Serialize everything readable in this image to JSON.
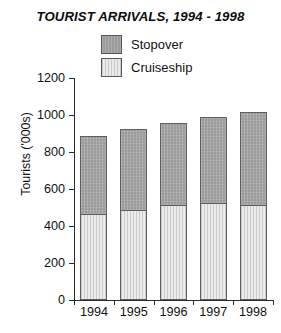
{
  "chart_data": {
    "type": "bar",
    "title": "TOURIST ARRIVALS, 1994 - 1998",
    "subtype": "stacked-vertical-bar",
    "xlabel": "",
    "ylabel": "Tourists ('000s)",
    "categories": [
      "1994",
      "1995",
      "1996",
      "1997",
      "1998"
    ],
    "series": [
      {
        "name": "Cruiseship",
        "values": [
          460,
          480,
          510,
          520,
          510
        ],
        "color": "#ececec",
        "border": "#5e5e5e",
        "stack_order": 1
      },
      {
        "name": "Stopover",
        "values": [
          425,
          445,
          445,
          470,
          505
        ],
        "color": "#9b9b9b",
        "border": "#5e5e5e",
        "stack_order": 2
      }
    ],
    "totals": [
      885,
      925,
      955,
      990,
      1015
    ],
    "ylim": [
      0,
      1200
    ],
    "yticks": [
      0,
      200,
      400,
      600,
      800,
      1000,
      1200
    ],
    "ytick_labels": [
      "0",
      "200",
      "400",
      "600",
      "800",
      "1000",
      "1200"
    ],
    "grid": false,
    "legend_position": "top-center",
    "legend_entries": [
      "Stopover",
      "Cruiseship"
    ]
  },
  "axes": {
    "y_title": "Tourists ('000s)"
  },
  "legend": {
    "items": [
      {
        "label": "Stopover",
        "swatch": "stopover-swatch"
      },
      {
        "label": "Cruiseship",
        "swatch": "cruiseship-swatch"
      }
    ]
  }
}
